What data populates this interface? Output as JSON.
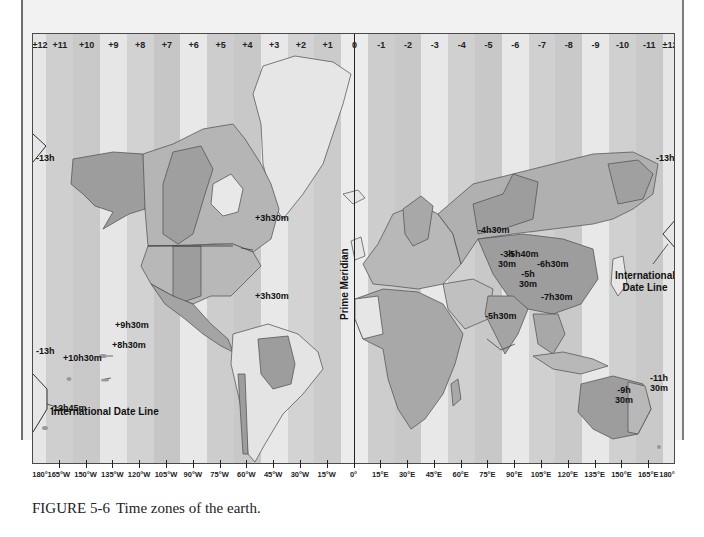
{
  "figure": {
    "number": "FIGURE 5-6",
    "caption": "Time zones of the earth."
  },
  "zones": [
    {
      "label": "±12",
      "shade": "#e6e6e6",
      "width": 1
    },
    {
      "label": "+11",
      "shade": "#cfcfcf",
      "width": 2
    },
    {
      "label": "+10",
      "shade": "#c9c9c9",
      "width": 2
    },
    {
      "label": "+9",
      "shade": "#e6e6e6",
      "width": 2
    },
    {
      "label": "+8",
      "shade": "#d2d2d2",
      "width": 2
    },
    {
      "label": "+7",
      "shade": "#c6c6c6",
      "width": 2
    },
    {
      "label": "+6",
      "shade": "#e8e8e8",
      "width": 2
    },
    {
      "label": "+5",
      "shade": "#cdcdcd",
      "width": 2
    },
    {
      "label": "+4",
      "shade": "#c8c8c8",
      "width": 2
    },
    {
      "label": "+3",
      "shade": "#e8e8e8",
      "width": 2
    },
    {
      "label": "+2",
      "shade": "#d3d3d3",
      "width": 2
    },
    {
      "label": "+1",
      "shade": "#cbcbcb",
      "width": 2
    },
    {
      "label": "0",
      "shade": "#ececec",
      "width": 2
    },
    {
      "label": "-1",
      "shade": "#cdcdcd",
      "width": 2
    },
    {
      "label": "-2",
      "shade": "#c8c8c8",
      "width": 2
    },
    {
      "label": "-3",
      "shade": "#e8e8e8",
      "width": 2
    },
    {
      "label": "-4",
      "shade": "#d0d0d0",
      "width": 2
    },
    {
      "label": "-5",
      "shade": "#c8c8c8",
      "width": 2
    },
    {
      "label": "-6",
      "shade": "#e8e8e8",
      "width": 2
    },
    {
      "label": "-7",
      "shade": "#d0d0d0",
      "width": 2
    },
    {
      "label": "-8",
      "shade": "#c9c9c9",
      "width": 2
    },
    {
      "label": "-9",
      "shade": "#e8e8e8",
      "width": 2
    },
    {
      "label": "-10",
      "shade": "#d0d0d0",
      "width": 2
    },
    {
      "label": "-11",
      "shade": "#c9c9c9",
      "width": 2
    },
    {
      "label": "±12",
      "shade": "#e6e6e6",
      "width": 1
    }
  ],
  "longitudes": [
    "180°",
    "165°W",
    "150°W",
    "135°W",
    "120°W",
    "105°W",
    "90°W",
    "75°W",
    "60°W",
    "45°W",
    "30°W",
    "15°W",
    "0°",
    "15°E",
    "30°E",
    "45°E",
    "60°E",
    "75°E",
    "90°E",
    "105°E",
    "120°E",
    "135°E",
    "150°E",
    "165°E",
    "180°"
  ],
  "labels": {
    "prime_meridian": "Prime Meridian",
    "idl_west": "International Date Line",
    "idl_east_line1": "International",
    "idl_east_line2": "Date Line"
  },
  "annotations": [
    {
      "id": "minus13h-alaska",
      "text": "-13h",
      "x": 3,
      "y": 152
    },
    {
      "id": "minus13h-east",
      "text": "-13h",
      "x": 623,
      "y": 152
    },
    {
      "id": "plus3h30m-newfoundland",
      "text": "+3h30m",
      "x": 222,
      "y": 212
    },
    {
      "id": "plus3h30m-guiana",
      "text": "+3h30m",
      "x": 222,
      "y": 290
    },
    {
      "id": "plus9h30m",
      "text": "+9h30m",
      "x": 82,
      "y": 319
    },
    {
      "id": "plus8h30m",
      "text": "+8h30m",
      "x": 79,
      "y": 339
    },
    {
      "id": "minus13h-west-pacific",
      "text": "-13h",
      "x": 3,
      "y": 345
    },
    {
      "id": "plus10h30m",
      "text": "+10h30m",
      "x": 30,
      "y": 352
    },
    {
      "id": "minus12h45m",
      "text": "-12h45m",
      "x": 17,
      "y": 402
    },
    {
      "id": "minus4h30m",
      "text": "-4h30m",
      "x": 445,
      "y": 224
    },
    {
      "id": "minus3h30m",
      "text": "-3h\n30m",
      "x": 465,
      "y": 248
    },
    {
      "id": "minus5h40m",
      "text": "-5h40m",
      "x": 474,
      "y": 248
    },
    {
      "id": "minus6h30m",
      "text": "-6h30m",
      "x": 504,
      "y": 258
    },
    {
      "id": "minus5h30m-india",
      "text": "-5h\n30m",
      "x": 486,
      "y": 268
    },
    {
      "id": "minus5h30m-srilanka",
      "text": "-5h30m",
      "x": 452,
      "y": 310
    },
    {
      "id": "minus7h30m",
      "text": "-7h30m",
      "x": 508,
      "y": 291
    },
    {
      "id": "minus9h30m",
      "text": "-9h\n30m",
      "x": 582,
      "y": 384
    },
    {
      "id": "minus11h30m",
      "text": "-11h\n30m",
      "x": 617,
      "y": 372
    }
  ],
  "colors": {
    "page_bg": "#f2f2f2",
    "frame": "#4a4a4a",
    "land_dark": "#9d9d9d",
    "land_mid": "#b8b8b8",
    "land_light": "#e4e4e4",
    "border": "#3c3c3c",
    "text": "#111111"
  }
}
